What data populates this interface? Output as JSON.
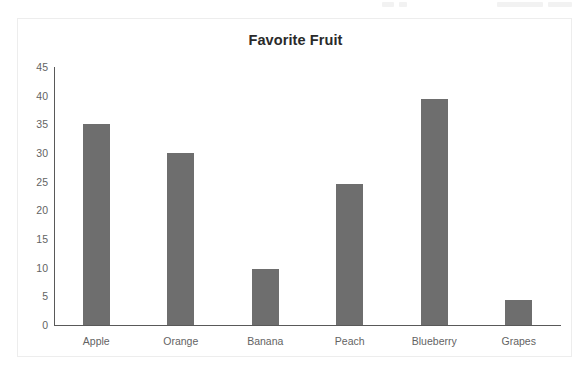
{
  "top_strip": {
    "present": true
  },
  "chart_data": {
    "type": "bar",
    "title": "Favorite Fruit",
    "xlabel": "",
    "ylabel": "",
    "categories": [
      "Apple",
      "Orange",
      "Banana",
      "Peach",
      "Blueberry",
      "Grapes"
    ],
    "values": [
      35,
      30,
      9.7,
      24.6,
      39.5,
      4.3
    ],
    "ylim": [
      0,
      45
    ],
    "yticks": [
      0,
      5,
      10,
      15,
      20,
      25,
      30,
      35,
      40,
      45
    ],
    "ytick_labels": [
      "0",
      "5",
      "10",
      "15",
      "20",
      "25",
      "30",
      "35",
      "40",
      "45"
    ],
    "grid": false,
    "legend": false,
    "bar_color": "#6e6e6e",
    "axis_color": "#595959",
    "tick_label_color": "#636363",
    "title_color": "#2a2a2a",
    "background": "#ffffff",
    "border_color": "#ededed"
  }
}
